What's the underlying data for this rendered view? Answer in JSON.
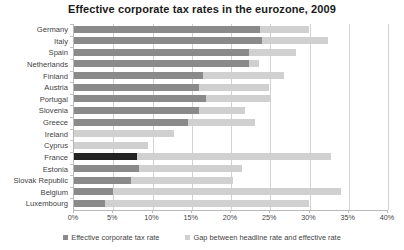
{
  "chart_data": {
    "type": "bar",
    "orientation": "horizontal",
    "stacked": true,
    "title": "Effective corporate tax rates in the eurozone, 2009",
    "xlabel": "",
    "ylabel": "",
    "xlim": [
      0,
      40
    ],
    "xticks": [
      0,
      5,
      10,
      15,
      20,
      25,
      30,
      35,
      40
    ],
    "xtick_labels": [
      "0%",
      "5%",
      "10%",
      "15%",
      "20%",
      "25%",
      "30%",
      "35%",
      "40%"
    ],
    "grid": "vertical",
    "legend_position": "bottom",
    "categories": [
      "Germany",
      "Italy",
      "Spain",
      "Netherlands",
      "Finland",
      "Austria",
      "Portugal",
      "Slovenia",
      "Greece",
      "Ireland",
      "Cyprus",
      "France",
      "Estonia",
      "Slovak Republic",
      "Belgium",
      "Luxembourg"
    ],
    "series": [
      {
        "name": "Effective corporate tax rate",
        "color": "#8a8a8a",
        "values": [
          23.7,
          24.0,
          22.3,
          22.3,
          16.4,
          15.9,
          16.8,
          15.9,
          14.5,
          0.0,
          0.0,
          8.0,
          8.3,
          7.3,
          5.0,
          4.0
        ]
      },
      {
        "name": "Gap between headline rate and effective rate",
        "color": "#d0d0d0",
        "values": [
          6.2,
          8.3,
          6.0,
          1.3,
          10.4,
          8.9,
          8.2,
          5.9,
          8.5,
          12.7,
          9.4,
          24.8,
          13.1,
          13.0,
          29.0,
          26.0
        ]
      }
    ],
    "highlight": {
      "category": "France",
      "color": "#232323",
      "note": "France effective-rate bar drawn in dark emphasis colour"
    },
    "totals": [
      29.9,
      32.3,
      28.3,
      23.6,
      26.8,
      24.8,
      25.0,
      21.8,
      23.0,
      12.7,
      9.4,
      32.8,
      21.4,
      20.3,
      34.0,
      30.0
    ]
  },
  "legend": {
    "items": [
      {
        "label": "Effective corporate tax rate",
        "swatch": "effective"
      },
      {
        "label": "Gap between headline rate and effective rate",
        "swatch": "gap"
      }
    ]
  }
}
